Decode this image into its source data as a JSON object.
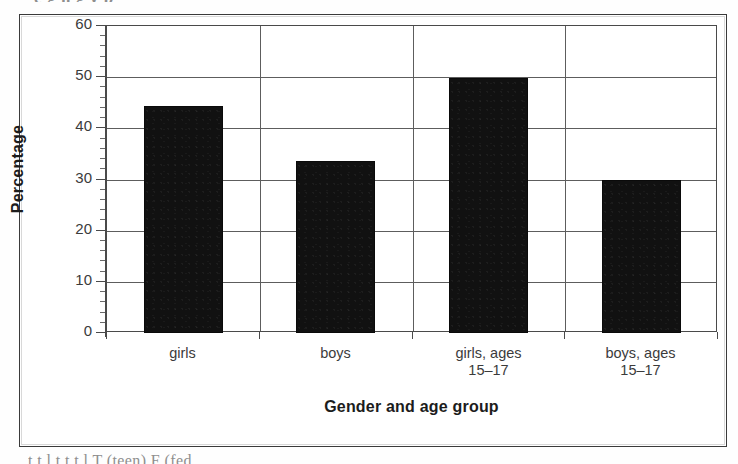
{
  "figure": {
    "bleed_text_top": "e  g       h       g    y     p",
    "bleed_text_bottom": "t      t   l    t        t  t   l    T (teen)    F (fed"
  },
  "chart_data": {
    "type": "bar",
    "title": "",
    "xlabel": "Gender and age group",
    "ylabel": "Percentage",
    "categories": [
      "girls",
      "boys",
      "girls, ages 15–17",
      "boys, ages 15–17"
    ],
    "category_lines": [
      [
        "girls",
        ""
      ],
      [
        "boys",
        ""
      ],
      [
        "girls, ages",
        "15–17"
      ],
      [
        "boys, ages",
        "15–17"
      ]
    ],
    "values": [
      44.3,
      33.6,
      49.8,
      29.9
    ],
    "ylim": [
      0,
      60
    ],
    "ytick_step": 10,
    "yticks": [
      0,
      10,
      20,
      30,
      40,
      50,
      60
    ],
    "ytick_labels": [
      "0",
      "10",
      "20",
      "30",
      "40",
      "50",
      "60"
    ],
    "minor_tick_step": 2,
    "grid": true,
    "grid_axis": "both",
    "legend": "none",
    "bar_color": "#111111",
    "bar_edge_color": "#0a0a0a",
    "axis_color": "#4a4a4a",
    "grid_color": "#5d5d5d",
    "background_color": "#ffffff"
  }
}
